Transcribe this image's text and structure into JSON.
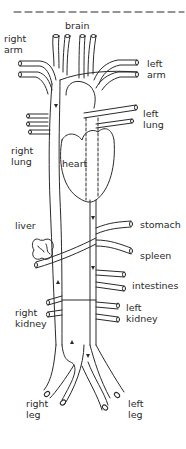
{
  "diagram": {
    "stroke_color": "#2a2a2a",
    "labels": {
      "brain": "brain",
      "right_arm": "right\narm",
      "left_arm": "left\narm",
      "left_lung": "left\nlung",
      "right_lung": "right\nlung",
      "heart": "heart",
      "liver": "liver",
      "stomach": "stomach",
      "spleen": "spleen",
      "intestines": "intestines",
      "right_kidney": "right\nkidney",
      "left_kidney": "left\nkidney",
      "right_leg": "right\nleg",
      "left_leg": "left\nleg"
    }
  }
}
